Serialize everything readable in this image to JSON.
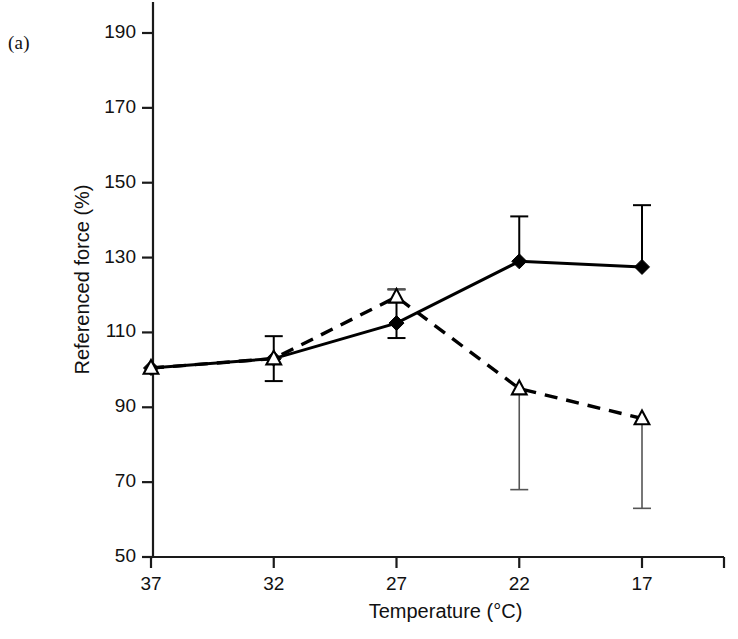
{
  "panel": {
    "label": "(a)"
  },
  "chart_data": {
    "type": "line",
    "title": "",
    "subtitle": "",
    "xlabel": "Temperature (°C)",
    "ylabel": "Referenced force (%)",
    "x": [
      37,
      32,
      27,
      22,
      17
    ],
    "xtick_labels": [
      "37",
      "32",
      "27",
      "22",
      "17"
    ],
    "x_axis_reversed": true,
    "xlim": [
      37,
      17
    ],
    "ylim": [
      50,
      196
    ],
    "ytick_labels": [
      "190",
      "170",
      "150",
      "130",
      "110",
      "90",
      "70",
      "50"
    ],
    "yticks": [
      190,
      170,
      150,
      130,
      110,
      90,
      70,
      50
    ],
    "grid": false,
    "legend": "none",
    "series": [
      {
        "name": "solid-filled-diamond",
        "marker": "filled-diamond",
        "linestyle": "solid",
        "color": "#000000",
        "values": [
          100.5,
          103.0,
          112.5,
          129.0,
          127.5
        ],
        "err_upper": [
          0,
          109.0,
          121.5,
          141.0,
          144.0
        ],
        "err_lower": [
          0,
          97.0,
          108.5,
          0,
          0
        ]
      },
      {
        "name": "dashed-open-triangle",
        "marker": "open-triangle",
        "linestyle": "dashed",
        "color": "#000000",
        "values": [
          100.5,
          103.0,
          119.5,
          95.0,
          87.0
        ],
        "err_upper": [
          0,
          0,
          121.5,
          0,
          0
        ],
        "err_lower": [
          0,
          0,
          0,
          68.0,
          63.0
        ]
      }
    ],
    "annotations": []
  },
  "colors": {
    "axis": "#1a1a1a",
    "ink": "#111111",
    "background": "#ffffff"
  }
}
